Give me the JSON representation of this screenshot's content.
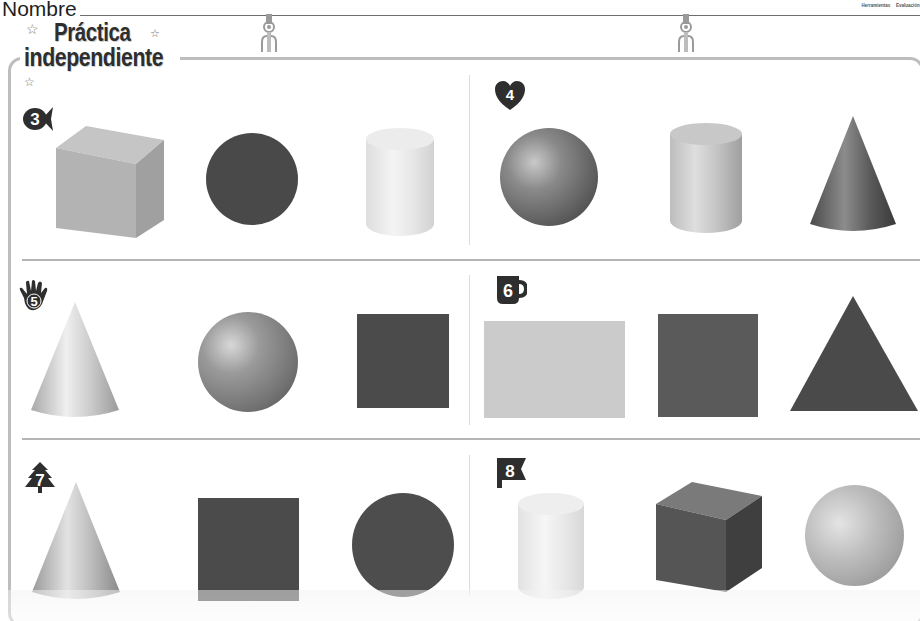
{
  "header": {
    "name_label": "Nombre",
    "tabs": [
      "Herramientas",
      "Evaluación"
    ]
  },
  "title": {
    "line1": "Práctica",
    "line2": "independiente",
    "decoration": "star-icon"
  },
  "exercises": [
    {
      "number": "3",
      "badge_icon": "fish-icon",
      "shapes": [
        {
          "name": "cube",
          "kind": "solid",
          "shade": "light-gray"
        },
        {
          "name": "circle",
          "kind": "plane",
          "shade": "dark-gray"
        },
        {
          "name": "cylinder",
          "kind": "solid",
          "shade": "white"
        }
      ]
    },
    {
      "number": "4",
      "badge_icon": "heart-icon",
      "shapes": [
        {
          "name": "sphere",
          "kind": "solid",
          "shade": "dark-gray"
        },
        {
          "name": "cylinder",
          "kind": "solid",
          "shade": "light-gray"
        },
        {
          "name": "cone",
          "kind": "solid",
          "shade": "dark-gray"
        }
      ]
    },
    {
      "number": "5",
      "badge_icon": "hand-icon",
      "shapes": [
        {
          "name": "cone",
          "kind": "solid",
          "shade": "light-gray"
        },
        {
          "name": "sphere",
          "kind": "solid",
          "shade": "medium-gray"
        },
        {
          "name": "square",
          "kind": "plane",
          "shade": "dark-gray"
        }
      ]
    },
    {
      "number": "6",
      "badge_icon": "mug-icon",
      "shapes": [
        {
          "name": "rectangle",
          "kind": "plane",
          "shade": "light-gray"
        },
        {
          "name": "square",
          "kind": "plane",
          "shade": "dark-gray"
        },
        {
          "name": "triangle",
          "kind": "plane",
          "shade": "dark-gray"
        }
      ]
    },
    {
      "number": "7",
      "badge_icon": "tree-icon",
      "shapes": [
        {
          "name": "cone",
          "kind": "solid",
          "shade": "light-gray"
        },
        {
          "name": "square",
          "kind": "plane",
          "shade": "dark-gray"
        },
        {
          "name": "circle",
          "kind": "plane",
          "shade": "dark-gray"
        }
      ]
    },
    {
      "number": "8",
      "badge_icon": "flag-icon",
      "shapes": [
        {
          "name": "cylinder",
          "kind": "solid",
          "shade": "white"
        },
        {
          "name": "cube",
          "kind": "solid",
          "shade": "dark-gray"
        },
        {
          "name": "sphere",
          "kind": "solid",
          "shade": "light-gray"
        }
      ]
    }
  ],
  "colors": {
    "ink": "#2e2e2e",
    "frame": "#bdbdbd",
    "divider": "#b5b5b5",
    "dark_fill": "#494949",
    "light_fill": "#cbcbcb"
  }
}
